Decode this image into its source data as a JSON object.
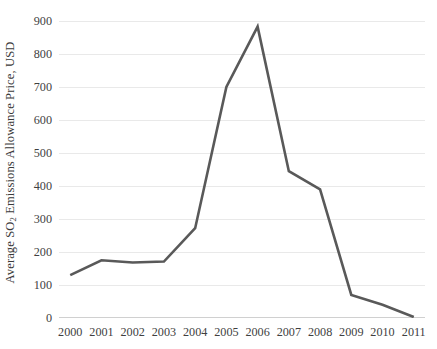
{
  "chart_data": {
    "type": "line",
    "title": "",
    "xlabel": "",
    "ylabel": "Average SO2 Emissions Allowance Price, USD",
    "ylabel_parts": {
      "before": "Average SO",
      "subscript": "2",
      "after": " Emissions Allowance Price, USD"
    },
    "categories": [
      "2000",
      "2001",
      "2002",
      "2003",
      "2004",
      "2005",
      "2006",
      "2007",
      "2008",
      "2009",
      "2010",
      "2011"
    ],
    "values": [
      130,
      175,
      168,
      171,
      272,
      700,
      883,
      445,
      390,
      70,
      40,
      3
    ],
    "series": [
      {
        "name": "Average SO2 Emissions Allowance Price",
        "values": [
          130,
          175,
          168,
          171,
          272,
          700,
          883,
          445,
          390,
          70,
          40,
          3
        ],
        "color": "#595959"
      }
    ],
    "ylim": [
      0,
      900
    ],
    "ytick_values": [
      0,
      100,
      200,
      300,
      400,
      500,
      600,
      700,
      800,
      900
    ],
    "ytick_labels": [
      "0",
      "100",
      "200",
      "300",
      "400",
      "500",
      "600",
      "700",
      "800",
      "900"
    ],
    "xtick_labels": [
      "2000",
      "2001",
      "2002",
      "2003",
      "2004",
      "2005",
      "2006",
      "2007",
      "2008",
      "2009",
      "2010",
      "2011"
    ],
    "grid": "horizontal",
    "legend": "none",
    "colors": {
      "line": "#595959",
      "gridline": "#e9e9e9",
      "axis": "#d0d0d0",
      "text": "#3f3f3f",
      "background": "#ffffff"
    }
  }
}
